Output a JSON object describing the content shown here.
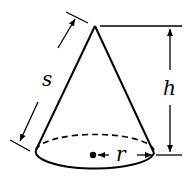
{
  "diagram": {
    "labels": {
      "slant_height": "s",
      "height": "h",
      "radius": "r"
    },
    "colors": {
      "stroke": "#000000",
      "background": "#ffffff"
    }
  }
}
